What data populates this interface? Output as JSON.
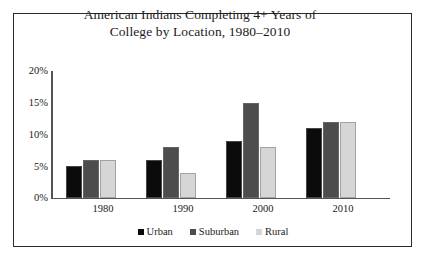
{
  "chart_data": {
    "type": "bar",
    "title": "American Indians Completing 4+ Years of College by Location, 1980–2010",
    "title_lines": [
      "American Indians Completing 4+ Years of",
      "College by Location, 1980–2010"
    ],
    "categories": [
      "1980",
      "1990",
      "2000",
      "2010"
    ],
    "series": [
      {
        "name": "Urban",
        "values": [
          5,
          6,
          9,
          11
        ],
        "color": "#0b0b0b"
      },
      {
        "name": "Suburban",
        "values": [
          6,
          8,
          15,
          12
        ],
        "color": "#4d4d4d"
      },
      {
        "name": "Rural",
        "values": [
          6,
          4,
          8,
          12
        ],
        "color": "#d6d6d6"
      }
    ],
    "xlabel": "",
    "ylabel": "",
    "ylim": [
      0,
      20
    ],
    "yticks": [
      0,
      5,
      10,
      15,
      20
    ],
    "ytick_labels": [
      "0%",
      "5%",
      "10%",
      "15%",
      "20%"
    ],
    "grid": false,
    "legend_position": "bottom"
  },
  "axes": {
    "y_ticks": [
      "20%",
      "15%",
      "10%",
      "5%",
      "0%"
    ],
    "x_ticks": [
      "1980",
      "1990",
      "2000",
      "2010"
    ]
  },
  "legend": {
    "items": [
      {
        "label": "Urban",
        "color": "#0b0b0b"
      },
      {
        "label": "Suburban",
        "color": "#4d4d4d"
      },
      {
        "label": "Rural",
        "color": "#d6d6d6"
      }
    ]
  },
  "style": {
    "frame_color": "#2b2b2b",
    "axis_color": "#555555",
    "text_color": "#1a1a1a",
    "background": "#ffffff"
  }
}
